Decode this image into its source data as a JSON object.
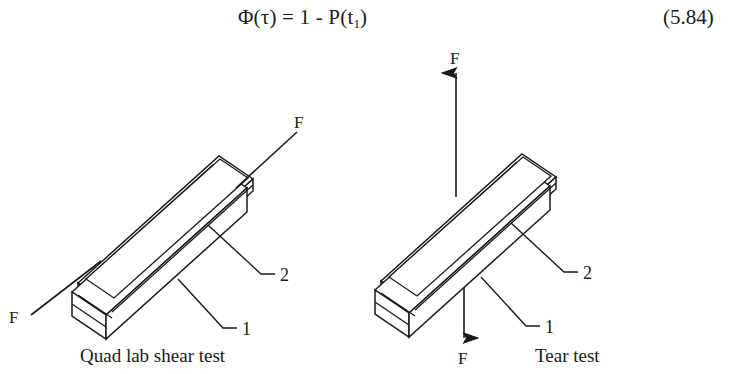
{
  "equation": {
    "lhs_text": "Φ(τ) = 1 - P(t",
    "subscript": "1",
    "closing": ")",
    "number": "(5.84)"
  },
  "figure": {
    "diagrams": [
      {
        "id": "quad-lab-shear-test",
        "caption": "Quad lab shear test",
        "loading": "diagonal-shear",
        "force_labels": [
          {
            "name": "force-label-upper-right",
            "text": "F"
          },
          {
            "name": "force-label-lower-left",
            "text": "F"
          }
        ],
        "callouts": [
          {
            "name": "callout-1",
            "text": "1"
          },
          {
            "name": "callout-2",
            "text": "2"
          }
        ]
      },
      {
        "id": "tear-test",
        "caption": "Tear test",
        "loading": "vertical-peel",
        "force_labels": [
          {
            "name": "force-label-top",
            "text": "F"
          },
          {
            "name": "force-label-bottom",
            "text": "F"
          }
        ],
        "callouts": [
          {
            "name": "callout-1",
            "text": "1"
          },
          {
            "name": "callout-2",
            "text": "2"
          }
        ]
      }
    ]
  },
  "colors": {
    "ink": "#1a1a1a",
    "paper": "#ffffff"
  }
}
